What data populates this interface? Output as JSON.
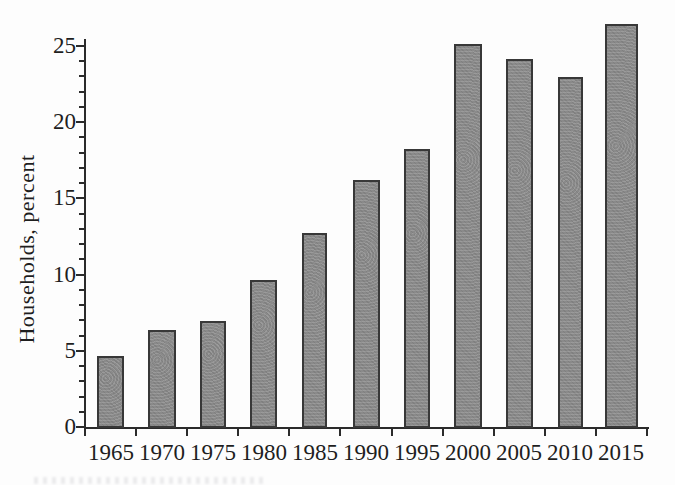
{
  "chart_data": {
    "type": "bar",
    "title": "",
    "categories": [
      "1965",
      "1970",
      "1975",
      "1980",
      "1985",
      "1990",
      "1995",
      "2000",
      "2005",
      "2010",
      "2015"
    ],
    "values": [
      4.7,
      6.4,
      7.0,
      9.7,
      12.8,
      16.3,
      18.3,
      25.2,
      24.2,
      23.0,
      26.5
    ],
    "xlabel": "",
    "ylabel": "Households, percent",
    "ylim": [
      0,
      25
    ],
    "y_major_ticks": [
      0,
      5,
      10,
      15,
      20,
      25
    ],
    "y_minor_step": 1,
    "grid": false,
    "legend": null,
    "colors": {
      "bar_fill": "#8a8a8a",
      "bar_border": "#383838",
      "axis": "#2b2b2b",
      "text": "#1e1e1e",
      "background": "#fdfdfd"
    }
  }
}
